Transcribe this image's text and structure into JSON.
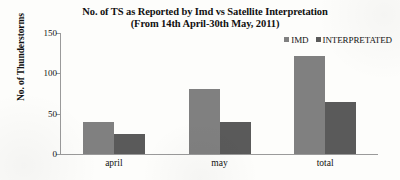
{
  "chart_data": {
    "type": "bar",
    "title": "No. of TS as Reported by Imd vs Satellite Interpretation",
    "subtitle": "(From 14th April-30th May, 2011)",
    "xlabel": "",
    "ylabel": "No. of Thunderstorms",
    "categories": [
      "april",
      "may",
      "total"
    ],
    "series": [
      {
        "name": "IMD",
        "values": [
          40,
          81,
          121
        ],
        "color": "#808080"
      },
      {
        "name": "INTERPRETATED",
        "values": [
          25,
          40,
          65
        ],
        "color": "#5a5a5a"
      }
    ],
    "ylim": [
      0,
      150
    ],
    "yticks": [
      0,
      50,
      100,
      150
    ],
    "ytick_labels": [
      "0",
      "50",
      "100",
      "150"
    ],
    "grid": false,
    "legend_position": "top-right",
    "axis_color": "#9a9a9a",
    "background": "#fdfdfb"
  }
}
